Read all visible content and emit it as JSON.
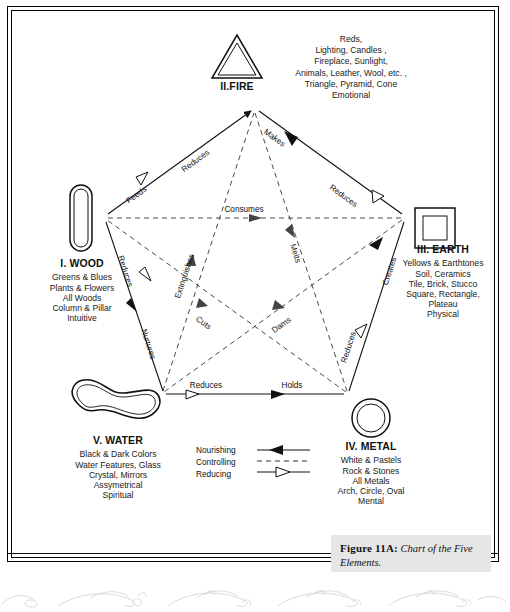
{
  "figure": {
    "caption_label": "Figure 11A:",
    "caption_text": " Chart of the Five Elements."
  },
  "elements": [
    {
      "id": "wood",
      "roman": "I. WOOD",
      "icon": "pillar-icon",
      "attributes": [
        "Greens & Blues",
        "Plants & Flowers",
        "All Woods",
        "Column & Pillar",
        "Intuitive"
      ]
    },
    {
      "id": "fire",
      "roman": "II.FIRE",
      "icon": "triangle-icon",
      "attributes": [
        "Reds,",
        "Lighting, Candles ,",
        "Fireplace, Sunlight,",
        "Animals, Leather, Wool, etc. ,",
        "Triangle, Pyramid, Cone",
        "Emotional"
      ]
    },
    {
      "id": "earth",
      "roman": "III. EARTH",
      "icon": "square-icon",
      "attributes": [
        "Yellows & Earthtones",
        "Soil, Ceramics",
        "Tile, Brick, Stucco",
        "Square, Rectangle,",
        "Plateau",
        "Physical"
      ]
    },
    {
      "id": "metal",
      "roman": "IV. METAL",
      "icon": "circle-icon",
      "attributes": [
        "White & Pastels",
        "Rock & Stones",
        "All Metals",
        "Arch, Circle, Oval",
        "Mental"
      ]
    },
    {
      "id": "water",
      "roman": "V. WATER",
      "icon": "wave-blob-icon",
      "attributes": [
        "Black & Dark Colors",
        "Water Features, Glass",
        "Crystal, Mirrors",
        "Assymetrical",
        "Spiritual"
      ]
    }
  ],
  "legend": {
    "rows": [
      {
        "label": "Nourishing",
        "style": "solid-filled-arrow"
      },
      {
        "label": "Controlling",
        "style": "dashed"
      },
      {
        "label": "Reducing",
        "style": "solid-hollow-arrow"
      }
    ]
  },
  "relations": {
    "nourishing": [
      {
        "label": "Feeds",
        "from": "wood",
        "to": "fire"
      },
      {
        "label": "Makes",
        "from": "fire",
        "to": "earth"
      },
      {
        "label": "Creates",
        "from": "earth",
        "to": "metal"
      },
      {
        "label": "Holds",
        "from": "metal",
        "to": "water"
      },
      {
        "label": "Nurtures",
        "from": "water",
        "to": "wood"
      }
    ],
    "controlling": [
      {
        "label": "Consumes",
        "from": "wood",
        "to": "earth"
      },
      {
        "label": "Melts",
        "from": "fire",
        "to": "metal"
      },
      {
        "label": "Dams",
        "from": "earth",
        "to": "water"
      },
      {
        "label": "Cuts",
        "from": "metal",
        "to": "wood"
      },
      {
        "label": "Extinguishes",
        "from": "water",
        "to": "fire"
      }
    ],
    "reducing": [
      {
        "label": "Reduces",
        "from": "fire",
        "to": "wood"
      },
      {
        "label": "Reduces",
        "from": "earth",
        "to": "fire"
      },
      {
        "label": "Reduces",
        "from": "metal",
        "to": "earth"
      },
      {
        "label": "Reduces",
        "from": "water",
        "to": "metal"
      },
      {
        "label": "Reduces",
        "from": "wood",
        "to": "water"
      }
    ]
  },
  "colors": {
    "ink": "#111111",
    "paper": "#ffffff",
    "caption_bg": "#e6e6e6"
  }
}
